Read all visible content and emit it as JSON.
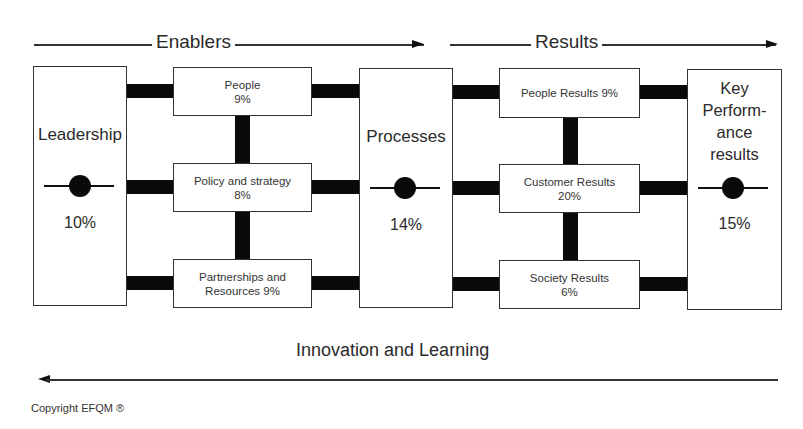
{
  "header": {
    "enablers_label": "Enablers",
    "results_label": "Results"
  },
  "pillars": {
    "leadership": {
      "label": "Leadership",
      "weight": "10%"
    },
    "processes": {
      "label": "Processes",
      "weight": "14%"
    },
    "key_performance": {
      "label_lines": [
        "Key",
        "Perform-",
        "ance",
        "results"
      ],
      "weight": "15%"
    }
  },
  "enablers": [
    {
      "line1": "People",
      "line2": "9%"
    },
    {
      "line1": "Policy and strategy",
      "line2": "8%"
    },
    {
      "line1": "Partnerships and",
      "line2": "Resources 9%"
    }
  ],
  "results": [
    {
      "line1": "People Results 9%",
      "line2": ""
    },
    {
      "line1": "Customer Results",
      "line2": "20%"
    },
    {
      "line1": "Society Results",
      "line2": "6%"
    }
  ],
  "footer": {
    "feedback_label": "Innovation and Learning",
    "copyright": "Copyright EFQM ®"
  },
  "colors": {
    "connector": "#0a0a0a",
    "border": "#333333",
    "text": "#2a2a2a",
    "background": "#ffffff"
  }
}
